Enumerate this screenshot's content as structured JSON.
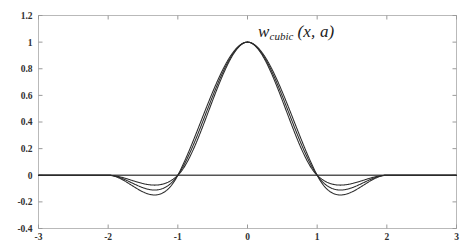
{
  "figure": {
    "background_color": "#ffffff",
    "frame_color": "#b9b9b9",
    "curve_color": "#2b2b2b",
    "title_main": "w",
    "title_subscript": "cubic",
    "title_args": "(x, a)"
  },
  "chart_data": {
    "type": "line",
    "xlabel": "",
    "ylabel": "",
    "xlim": [
      -3,
      3
    ],
    "ylim": [
      -0.4,
      1.2
    ],
    "grid": false,
    "legend": "none",
    "xticks": [
      -3,
      -2,
      -1,
      0,
      1,
      2,
      3
    ],
    "xtick_labels": [
      "-3",
      "-2",
      "-1",
      "0",
      "1",
      "2",
      "3"
    ],
    "yticks": [
      -0.4,
      -0.2,
      0,
      0.2,
      0.4,
      0.6,
      0.8,
      1,
      1.2
    ],
    "ytick_labels": [
      "-0.4",
      "-0.2",
      "0",
      "0.2",
      "0.4",
      "0.6",
      "0.8",
      "1",
      "1.2"
    ],
    "x": [
      -3,
      -2.75,
      -2.5,
      -2.25,
      -2,
      -1.9,
      -1.8,
      -1.7,
      -1.6,
      -1.5,
      -1.4,
      -1.3,
      -1.2,
      -1.1,
      -1,
      -0.9,
      -0.8,
      -0.7,
      -0.6,
      -0.5,
      -0.4,
      -0.3,
      -0.2,
      -0.1,
      0,
      0.1,
      0.2,
      0.3,
      0.4,
      0.5,
      0.6,
      0.7,
      0.8,
      0.9,
      1,
      1.1,
      1.2,
      1.3,
      1.4,
      1.5,
      1.6,
      1.7,
      1.8,
      1.9,
      2,
      2.25,
      2.5,
      2.75,
      3
    ],
    "series": [
      {
        "name": "a = -0.5",
        "values": [
          0,
          0,
          0,
          0,
          0,
          -0.0143,
          -0.0256,
          -0.0341,
          -0.04,
          -0.0437,
          -0.0452,
          -0.0449,
          -0.0429,
          -0.0394,
          -0.0347,
          0.0265,
          0.104,
          0.1905,
          0.2816,
          0.3725,
          0.4588,
          0.5358,
          0.5989,
          0.6438,
          1.0,
          0.6438,
          0.5989,
          0.5358,
          0.4588,
          0.3725,
          0.2816,
          0.1905,
          0.104,
          0.0265,
          -0.0347,
          -0.0394,
          -0.0429,
          -0.0449,
          -0.0452,
          -0.0437,
          -0.04,
          -0.0341,
          -0.0256,
          -0.0143,
          0,
          0,
          0,
          0,
          0
        ]
      },
      {
        "name": "a = -0.75",
        "values": [
          0,
          0,
          0,
          0,
          0,
          -0.0214,
          -0.0384,
          -0.0511,
          -0.06,
          -0.0656,
          -0.0678,
          -0.0674,
          -0.0644,
          -0.0591,
          -0.0521,
          0.031,
          0.128,
          0.233,
          0.34,
          0.443,
          0.536,
          0.614,
          0.671,
          0.704,
          1.0,
          0.704,
          0.671,
          0.614,
          0.536,
          0.443,
          0.34,
          0.233,
          0.128,
          0.031,
          -0.0521,
          -0.0591,
          -0.0644,
          -0.0674,
          -0.0678,
          -0.0656,
          -0.06,
          -0.0511,
          -0.0384,
          -0.0214,
          0,
          0,
          0,
          0,
          0
        ]
      },
      {
        "name": "a = -1",
        "values": [
          0,
          0,
          0,
          0,
          0,
          -0.0285,
          -0.0512,
          -0.0682,
          -0.08,
          -0.0875,
          -0.0904,
          -0.0899,
          -0.0858,
          -0.0788,
          -0.0694,
          0.0355,
          0.152,
          0.2755,
          0.3984,
          0.5135,
          0.6132,
          0.6923,
          0.7431,
          0.7641,
          1.0,
          0.7641,
          0.7431,
          0.6923,
          0.6132,
          0.5135,
          0.3984,
          0.2755,
          0.152,
          0.0355,
          -0.0694,
          -0.0788,
          -0.0858,
          -0.0899,
          -0.0904,
          -0.0875,
          -0.08,
          -0.0682,
          -0.0512,
          -0.0285,
          0,
          0,
          0,
          0,
          0
        ]
      }
    ],
    "annotations": [
      {
        "text": "w_cubic (x, a)",
        "x": 0.45,
        "y": 1.05
      }
    ],
    "notes": {
      "peak_value": 1.0,
      "support": [
        -2,
        2
      ],
      "zero_crossings": [
        -1,
        1
      ],
      "min_depths": [
        -0.0452,
        -0.0678,
        -0.0904
      ],
      "min_locations": [
        -1.4,
        1.4
      ]
    }
  }
}
